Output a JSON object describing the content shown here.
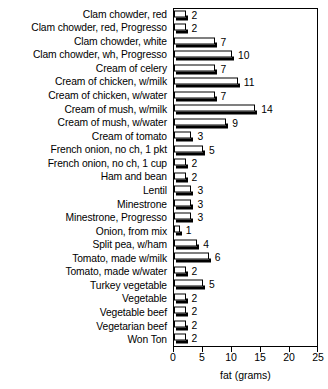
{
  "chart_data": {
    "type": "bar",
    "orientation": "horizontal",
    "title": "",
    "xlabel": "fat (grams)",
    "ylabel": "",
    "xlim": [
      0,
      25
    ],
    "xticks": [
      0,
      5,
      10,
      15,
      20,
      25
    ],
    "xtick_labels": [
      "0",
      "5",
      "10",
      "15",
      "20",
      "25"
    ],
    "grid": false,
    "legend": null,
    "value_labels_shown": true,
    "categories": [
      "Clam chowder, red",
      "Clam chowder, red, Progresso",
      "Clam chowder, white",
      "Clam chowder, wh, Progresso",
      "Cream of celery",
      "Cream of chicken, w/milk",
      "Cream of chicken, w/water",
      "Cream of mush, w/milk",
      "Cream of mush, w/water",
      "Cream of tomato",
      "French onion, no ch, 1 pkt",
      "French onion, no ch, 1 cup",
      "Ham and bean",
      "Lentil",
      "Minestrone",
      "Minestrone, Progresso",
      "Onion, from mix",
      "Split pea, w/ham",
      "Tomato, made w/milk",
      "Tomato, made w/water",
      "Turkey vegetable",
      "Vegetable",
      "Vegetable beef",
      "Vegetarian beef",
      "Won Ton"
    ],
    "values": [
      2,
      2,
      7,
      10,
      7,
      11,
      7,
      14,
      9,
      3,
      5,
      2,
      2,
      3,
      3,
      3,
      1,
      4,
      6,
      2,
      5,
      2,
      2,
      2,
      2
    ],
    "value_texts": [
      "2",
      "2",
      "7",
      "10",
      "7",
      "11",
      "7",
      "14",
      "9",
      "3",
      "5",
      "2",
      "2",
      "3",
      "3",
      "3",
      "1",
      "4",
      "6",
      "2",
      "5",
      "2",
      "2",
      "2",
      "2"
    ],
    "colors": {
      "bar_face": "#ffffff",
      "bar_outline": "#000000",
      "bar_shadow": "#000000",
      "axis": "#000000",
      "text": "#000000",
      "background": "#ffffff"
    }
  }
}
